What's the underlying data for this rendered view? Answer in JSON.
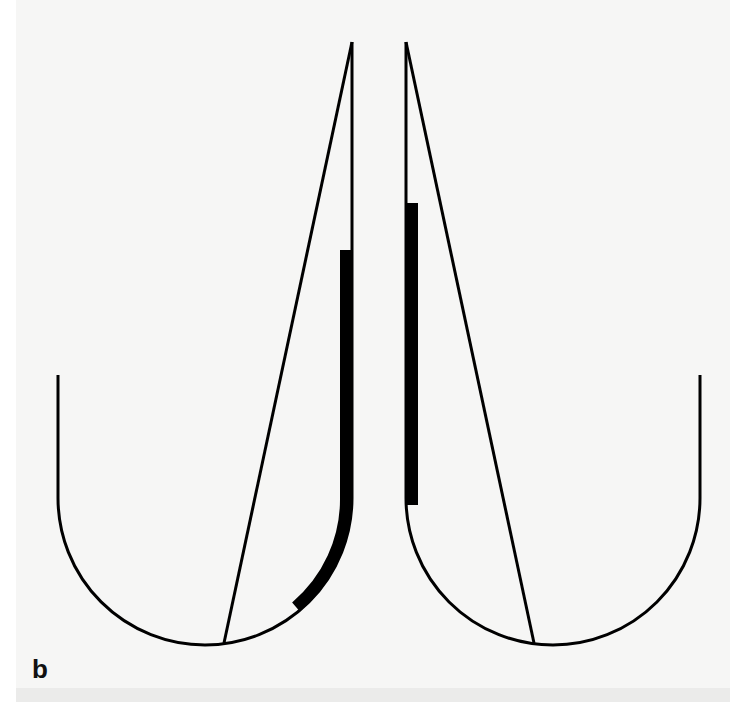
{
  "figure": {
    "panel_label": "b",
    "colors": {
      "background": "#f6f6f5",
      "stroke": "#000000"
    },
    "left_shape": {
      "outer_x": 58,
      "inner_x": 352,
      "top_outer_y": 375,
      "apex_y": 42,
      "arc_bottom_y": 645,
      "diagonal_end": [
        224,
        643
      ],
      "thick_bar_start_y": 250,
      "thick_bar_end": [
        293,
        605
      ]
    },
    "right_shape": {
      "inner_x": 406,
      "outer_x": 700,
      "top_outer_y": 375,
      "apex_y": 42,
      "arc_bottom_y": 645,
      "diagonal_end": [
        534,
        643
      ],
      "thick_bar_start_y": 203,
      "thick_bar_end_y": 505
    }
  }
}
